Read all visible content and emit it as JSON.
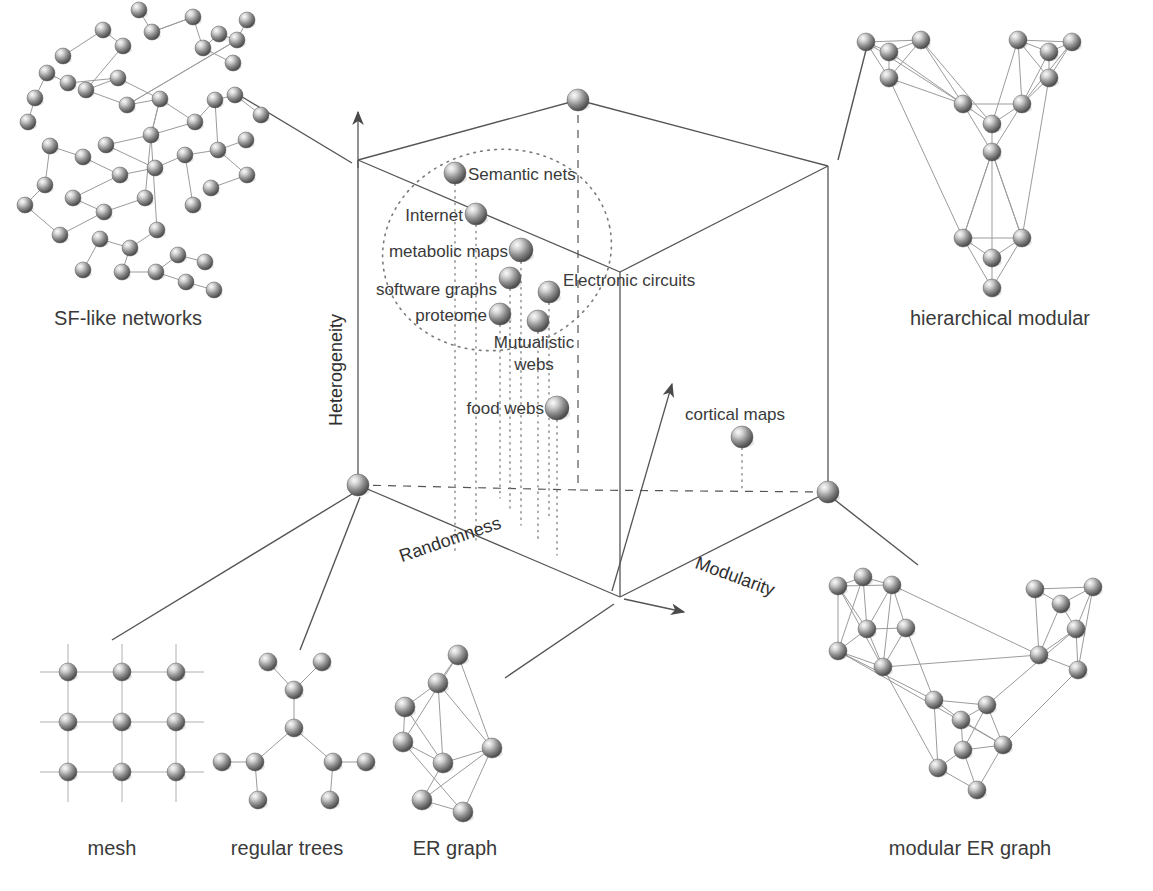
{
  "figure": {
    "type": "conceptual-3d-scatter",
    "title": "",
    "background": "#ffffff",
    "sphere_color_light": "#f2f2f2",
    "sphere_color_mid": "#9a9a9a",
    "sphere_color_dark": "#4a4a4a",
    "line_color": "#555555",
    "text_color": "#3a3a3a"
  },
  "axes": {
    "x": {
      "label": "Randomness",
      "arrow": true
    },
    "y": {
      "label": "Heterogeneity",
      "arrow": true
    },
    "z": {
      "label": "Modularity",
      "arrow": true
    }
  },
  "chart_data": {
    "type": "scatter",
    "xlabel": "Randomness",
    "ylabel": "Heterogeneity",
    "zlabel": "Modularity",
    "grid": false,
    "legend": "none",
    "points": [
      {
        "name": "Semantic nets",
        "label_side": "right",
        "x": 455,
        "y": 173,
        "r": 11,
        "lx": 468,
        "ly": 180,
        "drop_to": 555
      },
      {
        "name": "Internet",
        "label_side": "left",
        "x": 476,
        "y": 214,
        "r": 11,
        "lx": 463,
        "ly": 221,
        "drop_to": 545
      },
      {
        "name": "metabolic maps",
        "label_side": "left",
        "x": 521,
        "y": 250,
        "r": 12,
        "lx": 508,
        "ly": 257,
        "drop_to": 525
      },
      {
        "name": "software graphs",
        "label_side": "left",
        "x": 510,
        "y": 278,
        "r": 11,
        "lx": 497,
        "ly": 295,
        "drop_to": 512
      },
      {
        "name": "Electronic circuits",
        "label_side": "right",
        "x": 549,
        "y": 292,
        "r": 11,
        "lx": 563,
        "ly": 286,
        "drop_to": 520
      },
      {
        "name": "proteome",
        "label_side": "left",
        "x": 500,
        "y": 314,
        "r": 11,
        "lx": 487,
        "ly": 321,
        "drop_to": 498
      },
      {
        "name": "Mutualistic webs",
        "label_side": "below",
        "x": 538,
        "y": 321,
        "r": 11,
        "lx": 534,
        "ly": 348,
        "drop_to": 540
      },
      {
        "name": "food webs",
        "label_side": "left",
        "x": 557,
        "y": 408,
        "r": 12,
        "lx": 544,
        "ly": 414,
        "drop_to": 555
      },
      {
        "name": "cortical maps",
        "label_side": "above",
        "x": 742,
        "y": 437,
        "r": 11,
        "lx": 735,
        "ly": 420,
        "drop_to": 490
      }
    ],
    "cluster_outline": {
      "shape": "dotted-ellipse",
      "note": "dotted ellipse enclosing the heterogeneous / low-modularity network cluster",
      "cx": 497,
      "cy": 250,
      "rx": 115,
      "ry": 100,
      "rotation": -12
    },
    "cube_vertices": {
      "front_bottom_left": {
        "x": 358,
        "y": 485
      },
      "front_bottom_right": {
        "x": 828,
        "y": 492
      },
      "front_bottom_mid": {
        "x": 620,
        "y": 597
      },
      "front_top_left": {
        "x": 358,
        "y": 160
      },
      "front_top_mid": {
        "x": 620,
        "y": 272
      },
      "front_top_right": {
        "x": 828,
        "y": 166
      },
      "back_top": {
        "x": 578,
        "y": 100
      }
    }
  },
  "exemplars": [
    {
      "id": "sf-like-networks",
      "caption": "SF-like networks",
      "caption_x": 128,
      "caption_y": 325
    },
    {
      "id": "hierarchical-modular",
      "caption": "hierarchical modular",
      "caption_x": 1000,
      "caption_y": 325
    },
    {
      "id": "mesh",
      "caption": "mesh",
      "caption_x": 112,
      "caption_y": 855
    },
    {
      "id": "regular-trees",
      "caption": "regular trees",
      "caption_x": 287,
      "caption_y": 855
    },
    {
      "id": "er-graph",
      "caption": "ER graph",
      "caption_x": 455,
      "caption_y": 855
    },
    {
      "id": "modular-er-graph",
      "caption": "modular ER graph",
      "caption_x": 970,
      "caption_y": 855
    }
  ],
  "leader_lines": [
    {
      "from": "sf-like-networks",
      "x1": 234,
      "y1": 92,
      "x2": 352,
      "y2": 163
    },
    {
      "from": "hierarchical-modular",
      "x1": 838,
      "y1": 160,
      "x2": 866,
      "y2": 50
    },
    {
      "from": "mesh",
      "x1": 112,
      "y1": 640,
      "x2": 352,
      "y2": 494
    },
    {
      "from": "regular-trees",
      "x1": 300,
      "y1": 650,
      "x2": 360,
      "y2": 497
    },
    {
      "from": "er-graph",
      "x1": 505,
      "y1": 678,
      "x2": 614,
      "y2": 604
    },
    {
      "from": "modular-er-graph",
      "x1": 918,
      "y1": 565,
      "x2": 835,
      "y2": 500
    }
  ]
}
